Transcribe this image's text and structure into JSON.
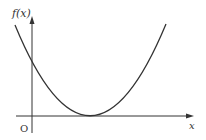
{
  "figure": {
    "y_axis_label": "f(x)",
    "x_axis_label": "x",
    "origin_label": "O",
    "curve": "parabola opening upward, tangent to x-axis at vertex, positive y-intercept",
    "colors": {
      "stroke": "#333333",
      "background": "#ffffff"
    }
  }
}
